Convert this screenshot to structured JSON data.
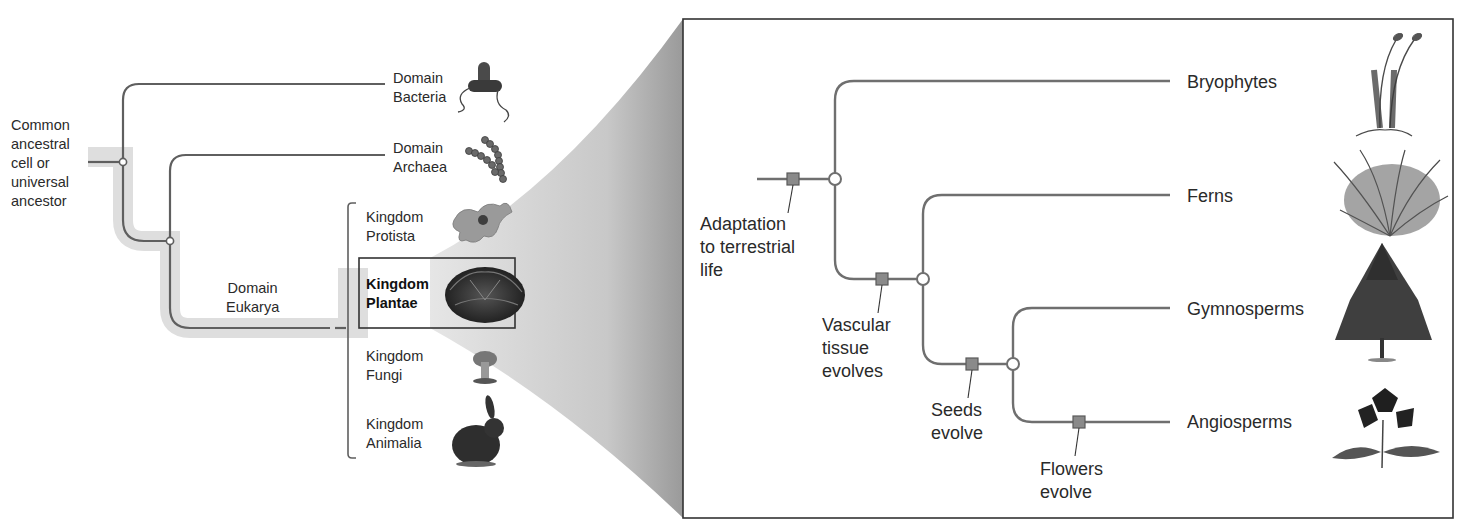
{
  "left_tree": {
    "root_label": "Common\nancestral\ncell or\nuniversal\nancestor",
    "domains": [
      {
        "label": "Domain\nBacteria",
        "icon": "bacterium-icon"
      },
      {
        "label": "Domain\nArchaea",
        "icon": "archaea-chain-icon"
      },
      {
        "label": "Domain\nEukarya",
        "icon": null
      }
    ],
    "kingdoms": [
      {
        "label": "Kingdom\nProtista",
        "icon": "protist-icon",
        "highlighted": false
      },
      {
        "label": "Kingdom\nPlantae",
        "icon": "plant-icon",
        "highlighted": true
      },
      {
        "label": "Kingdom\nFungi",
        "icon": "mushroom-icon",
        "highlighted": false
      },
      {
        "label": "Kingdom\nAnimalia",
        "icon": "rabbit-icon",
        "highlighted": false
      }
    ]
  },
  "right_tree": {
    "taxa": [
      {
        "label": "Bryophytes",
        "icon": "moss-icon"
      },
      {
        "label": "Ferns",
        "icon": "fern-icon"
      },
      {
        "label": "Gymnosperms",
        "icon": "conifer-tree-icon"
      },
      {
        "label": "Angiosperms",
        "icon": "flowering-plant-icon"
      }
    ],
    "events": [
      {
        "label": "Adaptation\nto terrestrial\nlife"
      },
      {
        "label": "Vascular\ntissue\nevolves"
      },
      {
        "label": "Seeds\nevolve"
      },
      {
        "label": "Flowers\nevolve"
      }
    ]
  },
  "colors": {
    "line": "#6f6f6f",
    "highlight_band": "#dcdcdc",
    "marker_fill": "#8a8a8a",
    "marker_stroke": "#5a5a5a",
    "wedge": "#c9c9c9",
    "box_border": "#333333"
  }
}
